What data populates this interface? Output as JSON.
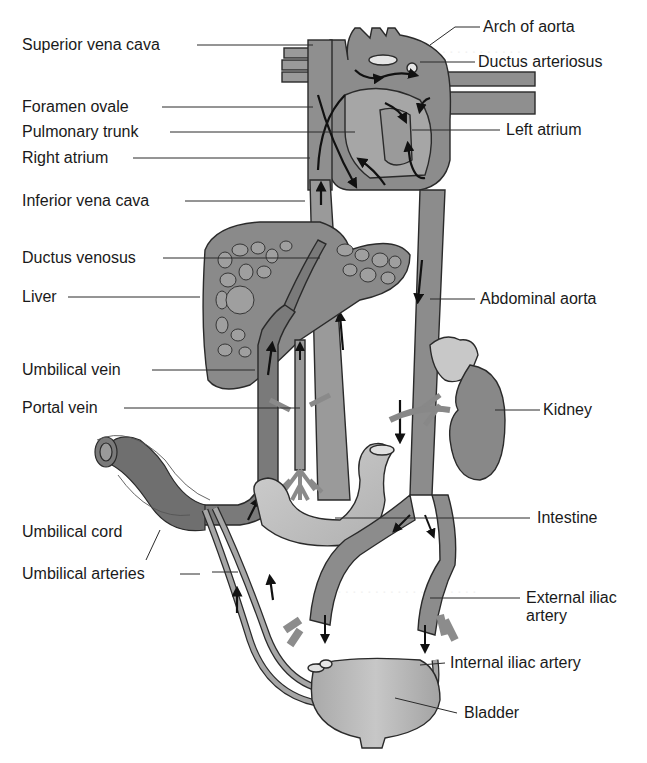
{
  "figure": {
    "colors": {
      "background": "#ffffff",
      "vessel_fill": "#8a8a8a",
      "vessel_dark": "#6f6f6f",
      "vessel_light": "#b4b4b4",
      "organ_light": "#c4c4c4",
      "outline": "#2a2a2a",
      "arrow": "#111111",
      "label_text": "#1a1a1a"
    },
    "labels_left": [
      {
        "id": "superior-vena-cava",
        "text": "Superior vena cava"
      },
      {
        "id": "foramen-ovale",
        "text": "Foramen ovale"
      },
      {
        "id": "pulmonary-trunk",
        "text": "Pulmonary trunk"
      },
      {
        "id": "right-atrium",
        "text": "Right atrium"
      },
      {
        "id": "inferior-vena-cava",
        "text": "Inferior vena cava"
      },
      {
        "id": "ductus-venosus",
        "text": "Ductus venosus"
      },
      {
        "id": "liver",
        "text": "Liver"
      },
      {
        "id": "umbilical-vein",
        "text": "Umbilical vein"
      },
      {
        "id": "portal-vein",
        "text": "Portal vein"
      },
      {
        "id": "umbilical-cord",
        "text": "Umbilical cord"
      },
      {
        "id": "umbilical-arteries",
        "text": "Umbilical arteries"
      }
    ],
    "labels_right": [
      {
        "id": "arch-of-aorta",
        "text": "Arch of aorta"
      },
      {
        "id": "ductus-arteriosus",
        "text": "Ductus arteriosus"
      },
      {
        "id": "left-atrium",
        "text": "Left atrium"
      },
      {
        "id": "abdominal-aorta",
        "text": "Abdominal aorta"
      },
      {
        "id": "kidney",
        "text": "Kidney"
      },
      {
        "id": "intestine",
        "text": "Intestine"
      },
      {
        "id": "external-iliac-artery",
        "text": "External iliac artery"
      },
      {
        "id": "internal-iliac-artery",
        "text": "Internal iliac artery"
      },
      {
        "id": "bladder",
        "text": "Bladder"
      }
    ]
  }
}
